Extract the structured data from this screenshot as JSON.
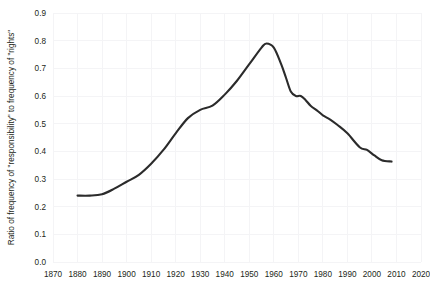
{
  "chart_data": {
    "type": "line",
    "title": "",
    "xlabel": "",
    "ylabel": "Ratio of frequency of \"responsibility\" to frequency of \"rights\"",
    "xlim": [
      1870,
      2020
    ],
    "ylim": [
      0.0,
      0.9
    ],
    "grid": true,
    "legend": "none",
    "xticks": [
      "1870",
      "1880",
      "1890",
      "1900",
      "1910",
      "1920",
      "1930",
      "1940",
      "1950",
      "1960",
      "1970",
      "1980",
      "1990",
      "2000",
      "2010",
      "2020"
    ],
    "yticks": [
      "0.0",
      "0.1",
      "0.2",
      "0.3",
      "0.4",
      "0.5",
      "0.6",
      "0.7",
      "0.8",
      "0.9"
    ],
    "series": [
      {
        "name": "responsibility / rights",
        "color": "#2b2b2b",
        "x": [
          1880,
          1885,
          1890,
          1895,
          1900,
          1905,
          1910,
          1915,
          1920,
          1925,
          1930,
          1935,
          1940,
          1945,
          1950,
          1955,
          1957,
          1960,
          1963,
          1965,
          1967,
          1969,
          1971,
          1973,
          1975,
          1978,
          1980,
          1983,
          1986,
          1990,
          1995,
          1998,
          2001,
          2004,
          2008
        ],
        "y": [
          0.24,
          0.24,
          0.245,
          0.265,
          0.29,
          0.315,
          0.355,
          0.405,
          0.465,
          0.52,
          0.55,
          0.565,
          0.605,
          0.655,
          0.715,
          0.775,
          0.79,
          0.775,
          0.715,
          0.665,
          0.615,
          0.6,
          0.6,
          0.585,
          0.565,
          0.545,
          0.53,
          0.515,
          0.495,
          0.465,
          0.415,
          0.405,
          0.385,
          0.368,
          0.363
        ]
      }
    ]
  },
  "plot": {
    "clipped_header_text": ""
  }
}
